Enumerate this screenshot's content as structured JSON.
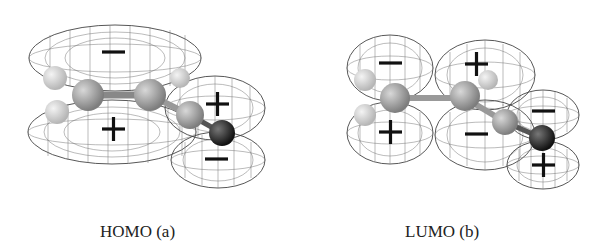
{
  "figures": [
    {
      "id": "homo",
      "caption": "HOMO (a)",
      "lobe_signs": [
        "−",
        "+",
        "+",
        "−"
      ]
    },
    {
      "id": "lumo",
      "caption": "LUMO (b)",
      "lobe_signs": [
        "−",
        "+",
        "+",
        "−",
        "−",
        "+"
      ]
    }
  ],
  "colors": {
    "background": "#ffffff",
    "mesh": "#444444",
    "atom_light": "#d8d8d8",
    "atom_mid": "#a8a8a8",
    "atom_dark": "#2a2a2a",
    "sign": "#111111"
  }
}
